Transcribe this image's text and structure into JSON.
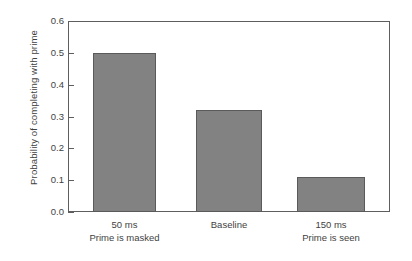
{
  "chart_data": {
    "type": "bar",
    "title": "",
    "xlabel": "",
    "ylabel": "Probability of completing with prime",
    "categories": [
      "50 ms",
      "Baseline",
      "150 ms"
    ],
    "category_sublabels": [
      "Prime is masked",
      "",
      "Prime is seen"
    ],
    "values": [
      0.5,
      0.32,
      0.11
    ],
    "ylim": [
      0.0,
      0.6
    ],
    "ytick_labels": [
      "0.0",
      "0.1",
      "0.2",
      "0.3",
      "0.4",
      "0.5",
      "0.6"
    ],
    "ytick_values": [
      0.0,
      0.1,
      0.2,
      0.3,
      0.4,
      0.5,
      0.6
    ],
    "grid": false,
    "legend": "none",
    "bar_color": "#828282",
    "bar_edge_color": "#5a5a5a",
    "frame_color": "#5e5e5e",
    "text_color": "#3f3f3f"
  }
}
